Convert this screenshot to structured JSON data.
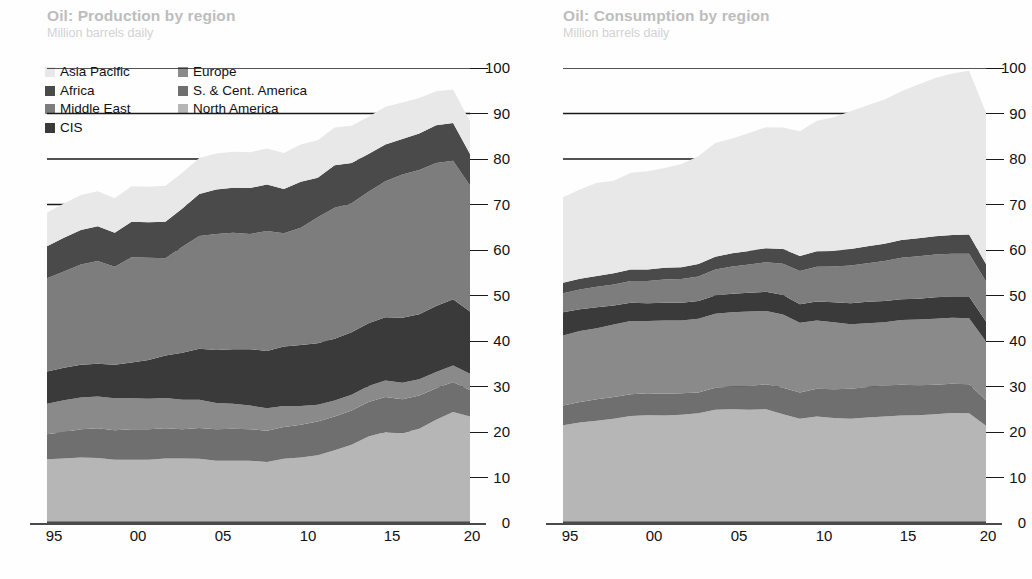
{
  "charts": [
    {
      "id": "production",
      "title": "Oil: Production by region",
      "subtitle": "Million barrels daily"
    },
    {
      "id": "consumption",
      "title": "Oil: Consumption by region",
      "subtitle": "Million barrels daily"
    }
  ],
  "legend": {
    "column_1": [
      {
        "label": "Asia Pacific",
        "color": "#e8e8e8",
        "swatch_name": "legend-swatch-asia-pacific"
      },
      {
        "label": "Africa",
        "color": "#4a4a4a",
        "swatch_name": "legend-swatch-africa"
      },
      {
        "label": "Middle East",
        "color": "#7d7d7d",
        "swatch_name": "legend-swatch-middle-east"
      },
      {
        "label": "CIS",
        "color": "#3a3a3a",
        "swatch_name": "legend-swatch-cis"
      }
    ],
    "column_2": [
      {
        "label": "Europe",
        "color": "#8a8a8a",
        "swatch_name": "legend-swatch-europe"
      },
      {
        "label": "S. & Cent. America",
        "color": "#6f6f6f",
        "swatch_name": "legend-swatch-s-cent-america"
      },
      {
        "label": "North America",
        "color": "#b6b6b6",
        "swatch_name": "legend-swatch-north-america"
      }
    ]
  },
  "axis": {
    "y_ticks": [
      "100",
      "90",
      "80",
      "70",
      "60",
      "50",
      "40",
      "30",
      "20",
      "10",
      "0"
    ],
    "x_ticks": [
      "95",
      "00",
      "05",
      "10",
      "15",
      "20"
    ]
  },
  "chart_data": [
    {
      "type": "area",
      "id": "production",
      "title": "Oil: Production by region",
      "subtitle": "Million barrels daily",
      "xlabel": "",
      "ylabel": "Million barrels daily",
      "ylim": [
        0,
        100
      ],
      "xlim": [
        1995,
        2020
      ],
      "grid": true,
      "legend_position": "top-left",
      "stacking": "bottom-to-top",
      "x": [
        1995,
        1996,
        1997,
        1998,
        1999,
        2000,
        2001,
        2002,
        2003,
        2004,
        2005,
        2006,
        2007,
        2008,
        2009,
        2010,
        2011,
        2012,
        2013,
        2014,
        2015,
        2016,
        2017,
        2018,
        2019,
        2020
      ],
      "series": [
        {
          "name": "North America",
          "color": "#b6b6b6",
          "values": [
            14.0,
            14.2,
            14.4,
            14.3,
            13.9,
            13.9,
            13.9,
            14.2,
            14.2,
            14.1,
            13.7,
            13.7,
            13.7,
            13.4,
            14.1,
            14.4,
            14.9,
            16.0,
            17.2,
            19.0,
            20.0,
            19.8,
            20.7,
            22.7,
            24.4,
            23.4
          ]
        },
        {
          "name": "S. & Cent. America",
          "color": "#6f6f6f",
          "values": [
            5.5,
            5.8,
            6.2,
            6.5,
            6.5,
            6.7,
            6.7,
            6.6,
            6.4,
            6.8,
            6.9,
            7.0,
            6.9,
            6.9,
            7.0,
            7.2,
            7.4,
            7.4,
            7.5,
            7.6,
            7.7,
            7.4,
            7.3,
            6.9,
            6.6,
            5.8
          ]
        },
        {
          "name": "Europe",
          "color": "#8a8a8a",
          "values": [
            6.7,
            7.0,
            7.0,
            7.0,
            7.0,
            6.8,
            6.7,
            6.7,
            6.5,
            6.2,
            5.8,
            5.5,
            5.2,
            4.9,
            4.6,
            4.1,
            3.7,
            3.5,
            3.5,
            3.5,
            3.6,
            3.6,
            3.6,
            3.6,
            3.6,
            3.6
          ]
        },
        {
          "name": "CIS",
          "color": "#3a3a3a",
          "values": [
            7.1,
            7.1,
            7.2,
            7.2,
            7.4,
            7.9,
            8.5,
            9.3,
            10.3,
            11.2,
            11.6,
            12.0,
            12.4,
            12.6,
            13.1,
            13.4,
            13.5,
            13.6,
            13.7,
            13.8,
            13.9,
            14.3,
            14.3,
            14.5,
            14.6,
            13.7
          ]
        },
        {
          "name": "Middle East",
          "color": "#7d7d7d",
          "values": [
            20.5,
            21.2,
            22.0,
            22.6,
            21.5,
            23.1,
            22.5,
            21.4,
            23.3,
            24.8,
            25.5,
            25.6,
            25.3,
            26.4,
            24.9,
            25.8,
            27.7,
            28.8,
            28.4,
            28.9,
            29.9,
            31.5,
            31.7,
            31.4,
            30.4,
            27.7
          ]
        },
        {
          "name": "Africa",
          "color": "#4a4a4a",
          "values": [
            7.0,
            7.4,
            7.6,
            7.6,
            7.5,
            7.8,
            7.8,
            8.0,
            8.4,
            9.2,
            9.8,
            9.9,
            10.1,
            10.2,
            9.7,
            10.1,
            8.7,
            9.3,
            8.8,
            8.3,
            8.1,
            7.8,
            8.0,
            8.3,
            8.3,
            6.9
          ]
        },
        {
          "name": "Asia Pacific",
          "color": "#e8e8e8",
          "values": [
            7.4,
            7.5,
            7.7,
            7.7,
            7.6,
            7.8,
            7.8,
            7.9,
            7.9,
            7.9,
            7.9,
            7.9,
            7.9,
            7.9,
            7.9,
            8.2,
            8.2,
            8.3,
            8.2,
            8.2,
            8.3,
            8.0,
            7.8,
            7.5,
            7.4,
            7.2
          ]
        }
      ]
    },
    {
      "type": "area",
      "id": "consumption",
      "title": "Oil: Consumption by region",
      "subtitle": "Million barrels daily",
      "xlabel": "",
      "ylabel": "Million barrels daily",
      "ylim": [
        0,
        100
      ],
      "xlim": [
        1995,
        2020
      ],
      "grid": true,
      "legend_position": "shared",
      "stacking": "bottom-to-top",
      "x": [
        1995,
        1996,
        1997,
        1998,
        1999,
        2000,
        2001,
        2002,
        2003,
        2004,
        2005,
        2006,
        2007,
        2008,
        2009,
        2010,
        2011,
        2012,
        2013,
        2014,
        2015,
        2016,
        2017,
        2018,
        2019,
        2020
      ],
      "series": [
        {
          "name": "North America",
          "color": "#b6b6b6",
          "values": [
            21.5,
            22.1,
            22.5,
            22.9,
            23.5,
            23.7,
            23.6,
            23.8,
            24.1,
            24.9,
            25.0,
            24.9,
            25.0,
            23.9,
            22.9,
            23.4,
            23.1,
            22.9,
            23.2,
            23.4,
            23.6,
            23.7,
            23.9,
            24.2,
            24.1,
            21.4
          ]
        },
        {
          "name": "S. & Cent. America",
          "color": "#6f6f6f",
          "values": [
            4.3,
            4.5,
            4.7,
            4.8,
            4.8,
            4.8,
            4.8,
            4.7,
            4.6,
            4.8,
            5.0,
            5.2,
            5.5,
            5.8,
            5.8,
            6.1,
            6.3,
            6.6,
            6.7,
            6.8,
            6.8,
            6.6,
            6.5,
            6.4,
            6.4,
            5.6
          ]
        },
        {
          "name": "Europe",
          "color": "#8a8a8a",
          "values": [
            15.4,
            15.6,
            15.6,
            15.9,
            16.1,
            15.9,
            16.1,
            16.0,
            16.2,
            16.3,
            16.3,
            16.4,
            16.1,
            16.1,
            15.3,
            15.0,
            14.7,
            14.2,
            14.0,
            13.9,
            14.2,
            14.4,
            14.5,
            14.5,
            14.5,
            12.9
          ]
        },
        {
          "name": "CIS",
          "color": "#3a3a3a",
          "values": [
            5.1,
            4.8,
            4.6,
            4.2,
            4.0,
            3.9,
            3.9,
            3.9,
            3.9,
            4.0,
            4.1,
            4.1,
            4.2,
            4.3,
            4.1,
            4.2,
            4.4,
            4.6,
            4.7,
            4.7,
            4.6,
            4.6,
            4.7,
            4.7,
            4.8,
            4.4
          ]
        },
        {
          "name": "Middle East",
          "color": "#7d7d7d",
          "values": [
            4.2,
            4.3,
            4.5,
            4.6,
            4.8,
            4.9,
            5.1,
            5.2,
            5.4,
            5.7,
            6.0,
            6.2,
            6.5,
            6.9,
            7.3,
            7.6,
            7.9,
            8.3,
            8.5,
            8.8,
            9.1,
            9.3,
            9.4,
            9.4,
            9.4,
            8.8
          ]
        },
        {
          "name": "Africa",
          "color": "#4a4a4a",
          "values": [
            2.3,
            2.4,
            2.4,
            2.5,
            2.5,
            2.5,
            2.6,
            2.6,
            2.7,
            2.8,
            2.9,
            3.0,
            3.1,
            3.2,
            3.3,
            3.4,
            3.4,
            3.6,
            3.7,
            3.8,
            3.9,
            4.0,
            4.0,
            4.1,
            4.2,
            3.8
          ]
        },
        {
          "name": "Asia Pacific",
          "color": "#e8e8e8",
          "values": [
            18.8,
            19.6,
            20.5,
            20.3,
            21.3,
            21.6,
            21.9,
            22.7,
            23.7,
            25.0,
            25.2,
            25.9,
            26.6,
            26.7,
            27.4,
            28.7,
            29.4,
            30.3,
            31.0,
            31.7,
            32.7,
            33.8,
            34.8,
            35.5,
            36.0,
            33.3
          ]
        }
      ]
    }
  ]
}
